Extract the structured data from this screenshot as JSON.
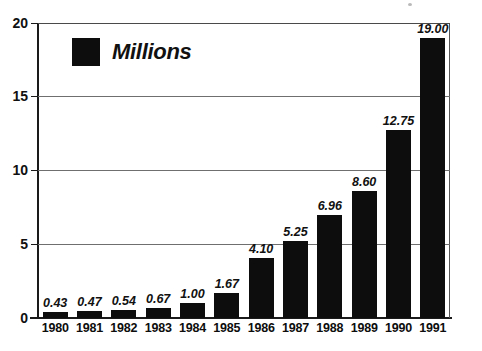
{
  "chart_data": {
    "type": "bar",
    "title": "",
    "subtitle": "",
    "xlabel": "",
    "ylabel": "",
    "categories": [
      "1980",
      "1981",
      "1982",
      "1983",
      "1984",
      "1985",
      "1986",
      "1987",
      "1988",
      "1989",
      "1990",
      "1991"
    ],
    "values": [
      0.43,
      0.47,
      0.54,
      0.67,
      1.0,
      1.67,
      4.1,
      5.25,
      6.96,
      8.6,
      12.75,
      19.0
    ],
    "value_labels": [
      "0.43",
      "0.47",
      "0.54",
      "0.67",
      "1.00",
      "1.67",
      "4.10",
      "5.25",
      "6.96",
      "8.60",
      "12.75",
      "19.00"
    ],
    "series": [
      {
        "name": "Millions",
        "values": [
          0.43,
          0.47,
          0.54,
          0.67,
          1.0,
          1.67,
          4.1,
          5.25,
          6.96,
          8.6,
          12.75,
          19.0
        ],
        "color": "#0d0d0d"
      }
    ],
    "ylim": [
      0,
      20
    ],
    "yticks": [
      0,
      5,
      10,
      15,
      20
    ],
    "ytick_labels": [
      "0",
      "5",
      "10",
      "15",
      "20"
    ],
    "grid": true,
    "grid_axis": "y",
    "legend": {
      "position": "inside-top-left",
      "entries": [
        {
          "label": "Millions",
          "color": "#0d0d0d",
          "swatch": "filled-square"
        }
      ]
    },
    "bar_color": "#0d0d0d",
    "background_color": "#ffffff",
    "axis_color": "#1a1a1a",
    "grid_color": "#6f6f6f"
  }
}
